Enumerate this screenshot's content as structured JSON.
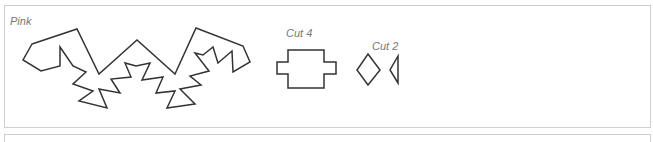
{
  "pattern_sheet": {
    "color_label": "Pink",
    "pieces": [
      {
        "id": "main-piece",
        "label": ""
      },
      {
        "id": "rect-piece",
        "label": "Cut 4"
      },
      {
        "id": "small-pieces",
        "label": "Cut 2"
      }
    ]
  },
  "colors": {
    "stroke": "#333333",
    "label": "#777777",
    "border": "#cfcfcf"
  }
}
